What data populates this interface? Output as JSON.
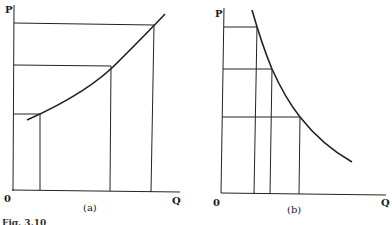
{
  "figure": {
    "caption": "Fig. 3.10",
    "panels": [
      {
        "id": "a",
        "caption": "(a)",
        "y_axis_label": "P",
        "x_axis_label": "Q",
        "origin_label": "0",
        "curve": "upward-sloping (convex) supply-type curve",
        "points": [
          {
            "q": 40,
            "p": 114
          },
          {
            "q": 110,
            "p": 65
          },
          {
            "q": 151,
            "p": 23
          }
        ]
      },
      {
        "id": "b",
        "caption": "(b)",
        "y_axis_label": "P",
        "x_axis_label": "Q",
        "origin_label": "0",
        "curve": "downward-sloping (convex) rectangular-hyperbola demand-type curve",
        "points": [
          {
            "q": 255,
            "p": 27
          },
          {
            "q": 271,
            "p": 69
          },
          {
            "q": 299,
            "p": 117
          }
        ]
      }
    ]
  }
}
